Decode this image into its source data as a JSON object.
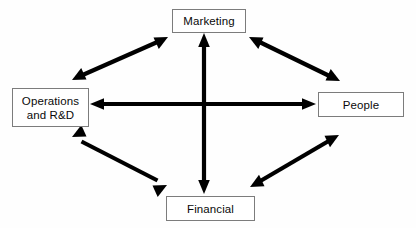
{
  "diagram": {
    "background_color": "#fefefe",
    "stroke_color": "#000000",
    "box_border_color": "#7c7c7c",
    "box_fill_color": "#ffffff",
    "text_color": "#0a0a0a",
    "nodes": [
      {
        "id": "marketing",
        "label": "Marketing",
        "lines": [
          "Marketing"
        ],
        "position": "top-center"
      },
      {
        "id": "operations",
        "label": "Operations and R&D",
        "lines": [
          "Operations",
          "and R&D"
        ],
        "position": "middle-left"
      },
      {
        "id": "people",
        "label": "People",
        "lines": [
          "People"
        ],
        "position": "middle-right"
      },
      {
        "id": "financial",
        "label": "Financial",
        "lines": [
          "Financial"
        ],
        "position": "bottom-center"
      }
    ],
    "connectors": [
      {
        "id": "operations-people",
        "from": "operations",
        "to": "people",
        "style": "double-arrow",
        "orientation": "horizontal"
      },
      {
        "id": "marketing-financial",
        "from": "marketing",
        "to": "financial",
        "style": "double-arrow",
        "orientation": "vertical"
      },
      {
        "id": "operations-marketing",
        "from": "operations",
        "to": "marketing",
        "style": "double-arrow",
        "orientation": "diagonal"
      },
      {
        "id": "marketing-people",
        "from": "marketing",
        "to": "people",
        "style": "double-arrow",
        "orientation": "diagonal"
      },
      {
        "id": "operations-financial",
        "from": "operations",
        "to": "financial",
        "style": "double-arrow",
        "orientation": "diagonal"
      },
      {
        "id": "financial-people",
        "from": "financial",
        "to": "people",
        "style": "double-arrow",
        "orientation": "diagonal"
      }
    ]
  }
}
